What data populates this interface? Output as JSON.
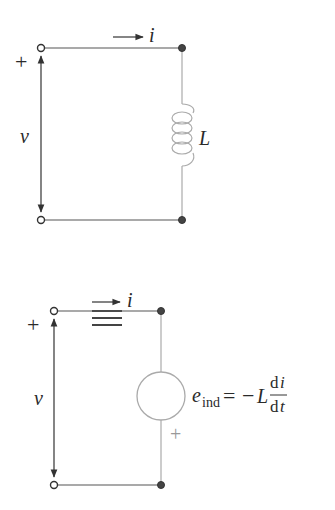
{
  "top_circuit": {
    "plus_sign": "+",
    "voltage_label": "v",
    "current_label": "i",
    "inductor_label": "L"
  },
  "equivalence_symbol": "≡",
  "bottom_circuit": {
    "plus_sign": "+",
    "voltage_label": "v",
    "current_label": "i",
    "source_plus_sign": "+",
    "emf_label": {
      "symbol": "e",
      "subscript": "ind",
      "equals": "=",
      "minus": "−",
      "coefficient": "L",
      "numerator": "di",
      "numerator_d": "d",
      "numerator_var": "i",
      "denominator_d": "d",
      "denominator_var": "t"
    }
  },
  "colors": {
    "wire_dark": "#555555",
    "wire_light": "#aaaaaa",
    "text": "#2a2a2a"
  }
}
